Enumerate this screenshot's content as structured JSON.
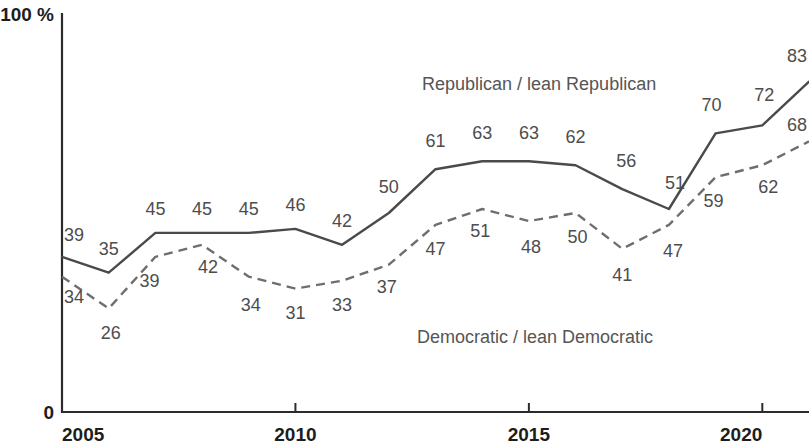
{
  "chart_data": {
    "type": "line",
    "title": "",
    "subtitle": "",
    "xlabel": "",
    "ylabel": "",
    "ylim": [
      0,
      100
    ],
    "xlim": [
      2005,
      2021
    ],
    "grid": false,
    "y_axis_top_label": "100 %",
    "y_axis_bottom_label": "0",
    "x_tick_labels": [
      "2005",
      "2010",
      "2015",
      "2020"
    ],
    "x_tick_values": [
      2005,
      2010,
      2015,
      2020
    ],
    "legend_position": "inline-annotation",
    "x": [
      2005,
      2006,
      2007,
      2008,
      2009,
      2010,
      2011,
      2012,
      2013,
      2014,
      2015,
      2016,
      2017,
      2018,
      2019,
      2020,
      2021
    ],
    "series": [
      {
        "name": "Republican / lean Republican",
        "style": "solid",
        "color": "#4a4a4a",
        "values": [
          39,
          35,
          45,
          45,
          45,
          46,
          42,
          50,
          61,
          63,
          63,
          62,
          56,
          51,
          70,
          72,
          83
        ],
        "labels": [
          "39",
          "35",
          "45",
          "45",
          "45",
          "46",
          "42",
          "50",
          "61",
          "63",
          "63",
          "62",
          "56",
          "51",
          "70",
          "72",
          "83"
        ]
      },
      {
        "name": "Democratic / lean Democratic",
        "style": "dashed",
        "color": "#6e6e6e",
        "values": [
          34,
          26,
          39,
          42,
          34,
          31,
          33,
          37,
          47,
          51,
          48,
          50,
          41,
          47,
          59,
          62,
          68
        ],
        "labels": [
          "34",
          "26",
          "39",
          "42",
          "34",
          "31",
          "33",
          "37",
          "47",
          "51",
          "48",
          "50",
          "41",
          "47",
          "59",
          "62",
          "68"
        ]
      }
    ],
    "annotations": [
      {
        "text": "Republican / lean Republican",
        "series": "Republican / lean Republican"
      },
      {
        "text": "Democratic / lean Democratic",
        "series": "Democratic / lean Democratic"
      }
    ]
  }
}
